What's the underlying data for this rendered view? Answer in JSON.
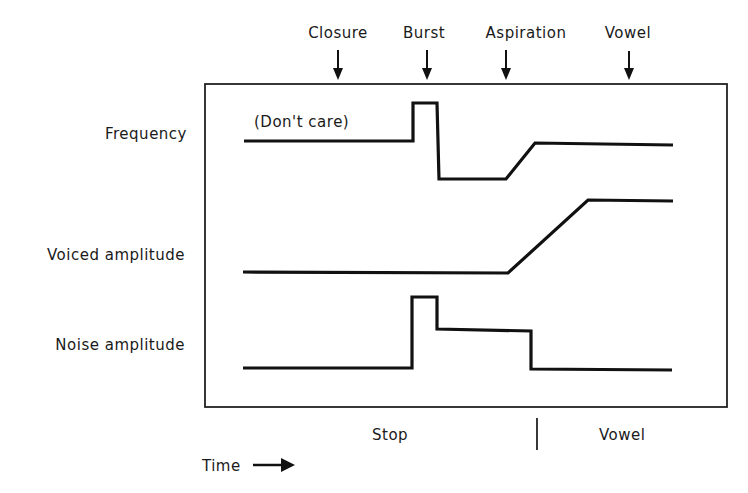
{
  "events": [
    {
      "label": "Closure",
      "x": 338
    },
    {
      "label": "Burst",
      "x": 427
    },
    {
      "label": "Aspiration",
      "x": 506
    },
    {
      "label": "Vowel",
      "x": 629
    }
  ],
  "rows": [
    {
      "label": "Frequency",
      "annotation": "(Don't care)"
    },
    {
      "label": "Voiced amplitude"
    },
    {
      "label": "Noise amplitude"
    }
  ],
  "segments": {
    "stop": "Stop",
    "vowel": "Vowel"
  },
  "axis": {
    "time_label": "Time"
  },
  "colors": {
    "ink": "#111111",
    "background": "#ffffff"
  }
}
